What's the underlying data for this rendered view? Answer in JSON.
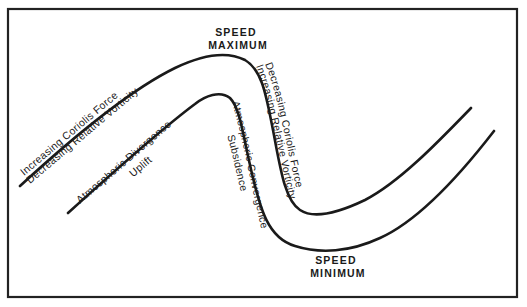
{
  "diagram": {
    "type": "jet-stream wave schematic",
    "labels": {
      "speed_max_line1": "SPEED",
      "speed_max_line2": "MAXIMUM",
      "speed_min_line1": "SPEED",
      "speed_min_line2": "MINIMUM",
      "left_upper_1": "Increasing Coriolis Force",
      "left_upper_2": "Decreasing Relative Vorticity",
      "left_lower_1": "Atmospheric Divergence",
      "left_lower_2": "Uplift",
      "right_upper_1": "Decreasing Coriolis Force",
      "right_upper_2": "Increasing Relative Vorticity",
      "right_lower_1": "Atmospheric Convergence",
      "right_lower_2": "Subsidence"
    },
    "colors": {
      "line": "#1a1a1a",
      "background": "#ffffff"
    }
  }
}
